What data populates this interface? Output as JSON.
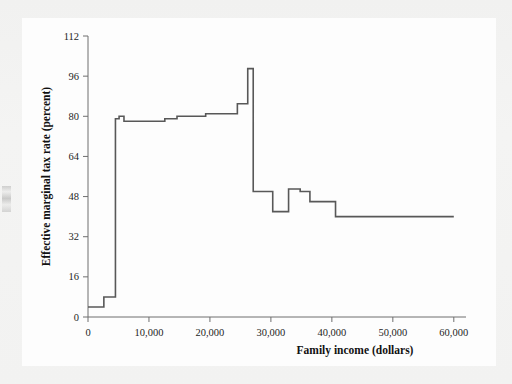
{
  "chart_data": {
    "type": "line",
    "subtype": "step",
    "title": "",
    "xlabel": "Family income (dollars)",
    "ylabel": "Effective marginal tax rate (percent)",
    "xlim": [
      0,
      62000
    ],
    "ylim": [
      0,
      112
    ],
    "xticks": [
      0,
      10000,
      20000,
      30000,
      40000,
      50000,
      60000
    ],
    "xtick_labels": [
      "0",
      "10,000",
      "20,000",
      "30,000",
      "40,000",
      "50,000",
      "60,000"
    ],
    "yticks": [
      0,
      16,
      32,
      48,
      64,
      80,
      96,
      112
    ],
    "ytick_labels": [
      "0",
      "16",
      "32",
      "48",
      "64",
      "80",
      "96",
      "112"
    ],
    "grid": false,
    "legend": false,
    "line_color": "#585858",
    "axis_color": "#6e6e6e",
    "background_color": "#fdfdfd",
    "page_color": "#f3f3f2",
    "steps": [
      {
        "x_start": 0,
        "x_end": 2600,
        "y": 4
      },
      {
        "x_start": 2600,
        "x_end": 4500,
        "y": 8
      },
      {
        "x_start": 4500,
        "x_end": 5100,
        "y": 79
      },
      {
        "x_start": 5100,
        "x_end": 5900,
        "y": 80
      },
      {
        "x_start": 5900,
        "x_end": 12600,
        "y": 78
      },
      {
        "x_start": 12600,
        "x_end": 14600,
        "y": 79
      },
      {
        "x_start": 14600,
        "x_end": 19300,
        "y": 80
      },
      {
        "x_start": 19300,
        "x_end": 24500,
        "y": 81
      },
      {
        "x_start": 24500,
        "x_end": 26200,
        "y": 85
      },
      {
        "x_start": 26200,
        "x_end": 27100,
        "y": 99
      },
      {
        "x_start": 27100,
        "x_end": 30300,
        "y": 50
      },
      {
        "x_start": 30300,
        "x_end": 32900,
        "y": 42
      },
      {
        "x_start": 32900,
        "x_end": 34800,
        "y": 51
      },
      {
        "x_start": 34800,
        "x_end": 36400,
        "y": 50
      },
      {
        "x_start": 36400,
        "x_end": 40600,
        "y": 46
      },
      {
        "x_start": 40600,
        "x_end": 60000,
        "y": 40
      }
    ]
  },
  "figure": {
    "caption": ""
  }
}
